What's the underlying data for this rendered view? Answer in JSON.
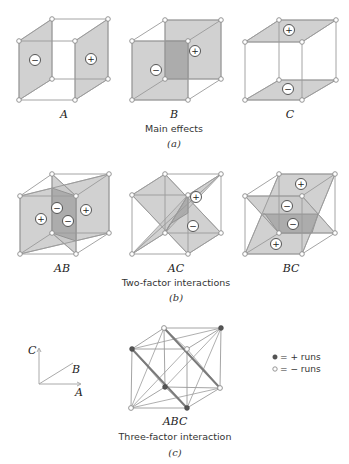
{
  "figure": {
    "sections": [
      {
        "id": "a",
        "caption": "Main effects",
        "part_label": "(a)"
      },
      {
        "id": "b",
        "caption": "Two-factor interactions",
        "part_label": "(b)"
      },
      {
        "id": "c",
        "caption": "Three-factor interaction",
        "part_label": "(c)"
      }
    ],
    "cubes": {
      "A": {
        "label": "A",
        "signs": [
          "−",
          "+"
        ]
      },
      "B": {
        "label": "B",
        "signs": [
          "−",
          "+"
        ]
      },
      "C": {
        "label": "C",
        "signs": [
          "+",
          "−"
        ]
      },
      "AB": {
        "label": "AB",
        "signs": [
          "+",
          "−",
          "−",
          "+"
        ]
      },
      "AC": {
        "label": "AC",
        "signs": [
          "+",
          "−"
        ]
      },
      "BC": {
        "label": "BC",
        "signs": [
          "+",
          "−",
          "−",
          "+"
        ]
      },
      "ABC": {
        "label": "ABC"
      }
    },
    "axes": {
      "x": "A",
      "y": "C",
      "z": "B"
    },
    "legend": {
      "plus_runs": "= + runs",
      "minus_runs": "= − runs"
    }
  }
}
